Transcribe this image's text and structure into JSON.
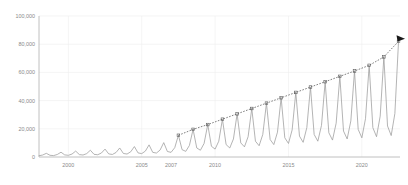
{
  "chart_data": {
    "type": "line",
    "title": "",
    "subtitle": "",
    "xlabel": "",
    "ylabel": "",
    "grid": true,
    "legend_position": "none",
    "xlim": [
      1998.0,
      2022.6
    ],
    "ylim": [
      0,
      100000
    ],
    "y_ticks": [
      0,
      20000,
      40000,
      60000,
      80000,
      100000
    ],
    "y_tick_labels": [
      "0",
      "20,000",
      "40,000",
      "60,000",
      "80,000",
      "100,000"
    ],
    "x_ticks": [
      2000,
      2005,
      2007,
      2010,
      2015,
      2020
    ],
    "x_tick_labels": [
      "2000",
      "2005",
      "2007",
      "2010",
      "2015",
      "2020"
    ],
    "series": [
      {
        "name": "seasonal-series",
        "type": "line",
        "color": "#9b9b9b",
        "description": "Seasonal sawtooth series with steadily growing annual peaks",
        "x": [
          1998.0,
          1998.25,
          1998.5,
          1998.75,
          1999.0,
          1999.25,
          1999.5,
          1999.75,
          2000.0,
          2000.25,
          2000.5,
          2000.75,
          2001.0,
          2001.25,
          2001.5,
          2001.75,
          2002.0,
          2002.25,
          2002.5,
          2002.75,
          2003.0,
          2003.25,
          2003.5,
          2003.75,
          2004.0,
          2004.25,
          2004.5,
          2004.75,
          2005.0,
          2005.25,
          2005.5,
          2005.75,
          2006.0,
          2006.25,
          2006.5,
          2006.75,
          2007.0,
          2007.25,
          2007.5,
          2007.75,
          2008.0,
          2008.25,
          2008.5,
          2008.75,
          2009.0,
          2009.25,
          2009.5,
          2009.75,
          2010.0,
          2010.25,
          2010.5,
          2010.75,
          2011.0,
          2011.25,
          2011.5,
          2011.75,
          2012.0,
          2012.25,
          2012.5,
          2012.75,
          2013.0,
          2013.25,
          2013.5,
          2013.75,
          2014.0,
          2014.25,
          2014.5,
          2014.75,
          2015.0,
          2015.25,
          2015.5,
          2015.75,
          2016.0,
          2016.25,
          2016.5,
          2016.75,
          2017.0,
          2017.25,
          2017.5,
          2017.75,
          2018.0,
          2018.25,
          2018.5,
          2018.75,
          2019.0,
          2019.25,
          2019.5,
          2019.75,
          2020.0,
          2020.25,
          2020.5,
          2020.75,
          2021.0,
          2021.25,
          2021.5,
          2021.75,
          2022.0,
          2022.25,
          2022.5
        ],
        "y": [
          900,
          1400,
          2600,
          1200,
          1000,
          1800,
          3400,
          1500,
          1200,
          2100,
          4200,
          1700,
          1400,
          2400,
          4800,
          1900,
          1600,
          2800,
          5600,
          2200,
          1800,
          3200,
          6400,
          2500,
          2100,
          3700,
          7400,
          2900,
          2400,
          4200,
          8600,
          3300,
          2800,
          4900,
          10200,
          3900,
          3300,
          6600,
          15400,
          5200,
          4000,
          8200,
          19600,
          6400,
          4800,
          9600,
          23000,
          7600,
          5600,
          11200,
          26800,
          8800,
          6400,
          12800,
          30600,
          10000,
          7200,
          14400,
          34400,
          11200,
          8000,
          16000,
          38200,
          12400,
          8800,
          17600,
          42000,
          13600,
          9600,
          19200,
          45800,
          14800,
          10400,
          20800,
          49600,
          16000,
          11200,
          22400,
          53400,
          17200,
          12000,
          24000,
          57200,
          18400,
          12800,
          25600,
          61000,
          19600,
          13600,
          27200,
          65000,
          20800,
          14400,
          29000,
          71000,
          22000,
          15200,
          30800,
          82000
        ]
      },
      {
        "name": "trend-line",
        "type": "line",
        "style": "dashed",
        "color": "#4a4a4a",
        "description": "Dashed linear trend through annual peaks, 2007 onward, terminating in arrowhead",
        "marker": "square",
        "x": [
          2007.5,
          2008.5,
          2009.5,
          2010.5,
          2011.5,
          2012.5,
          2013.5,
          2014.5,
          2015.5,
          2016.5,
          2017.5,
          2018.5,
          2019.5,
          2020.5,
          2021.5,
          2022.5
        ],
        "y": [
          15400,
          19600,
          23000,
          26800,
          30600,
          34400,
          38200,
          42000,
          45800,
          49600,
          53400,
          57200,
          61000,
          65000,
          71000,
          82000
        ],
        "arrow_end": true,
        "arrow_label": "arrow-marker"
      }
    ],
    "annotations": []
  }
}
